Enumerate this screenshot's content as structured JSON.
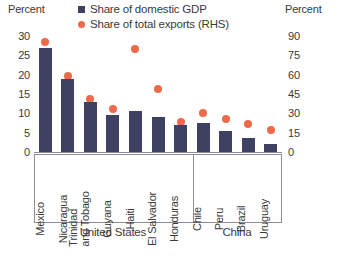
{
  "chart_data": {
    "type": "bar",
    "title": "",
    "subtitle": "",
    "xlabel": "",
    "ylabel": "Percent",
    "ylabel_right": "Percent",
    "grid": false,
    "legend_position": "top",
    "categories": [
      "Mexico",
      "Nicaragua",
      "Trinidad and Tobago",
      "Guyana",
      "Haiti",
      "El Salvador",
      "Honduras",
      "Chile",
      "Peru",
      "Brazil",
      "Uruguay"
    ],
    "category_lines": [
      [
        "Mexico"
      ],
      [
        "Nicaragua"
      ],
      [
        "Trinidad",
        "and Tobago"
      ],
      [
        "Guyana"
      ],
      [
        "Haiti"
      ],
      [
        "El Salvador"
      ],
      [
        "Honduras"
      ],
      [
        "Chile"
      ],
      [
        "Peru"
      ],
      [
        "Brazil"
      ],
      [
        "Uruguay"
      ]
    ],
    "groups": [
      {
        "label": "United States",
        "start": 0,
        "end": 6
      },
      {
        "label": "China",
        "start": 7,
        "end": 10
      }
    ],
    "series": [
      {
        "name": "Share of domestic GDP",
        "type": "bar",
        "axis": "left",
        "color": "#3f4162",
        "values": [
          27,
          19,
          13,
          9.5,
          10.5,
          9,
          7,
          7.5,
          5.5,
          3.5,
          2
        ]
      },
      {
        "name": "Share of total exports (RHS)",
        "type": "scatter",
        "axis": "right",
        "color": "#ef6a4a",
        "values": [
          85,
          59,
          41,
          33,
          80,
          49,
          23,
          30,
          26,
          22,
          17
        ]
      }
    ],
    "ylim": [
      0,
      30
    ],
    "yticks": [
      0,
      5,
      10,
      15,
      20,
      25,
      30
    ],
    "ylim_right": [
      0,
      90
    ],
    "yticks_right": [
      0,
      15,
      30,
      45,
      60,
      75,
      90
    ]
  },
  "legend": {
    "items": [
      {
        "label": "Share of domestic GDP",
        "marker": "square-marker",
        "color": "#3f4162"
      },
      {
        "label": "Share of total exports (RHS)",
        "marker": "dot-marker",
        "color": "#ef6a4a"
      }
    ]
  },
  "axes": {
    "left_unit": "Percent",
    "right_unit": "Percent"
  }
}
